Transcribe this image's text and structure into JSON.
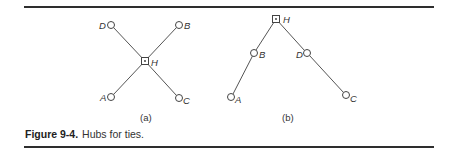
{
  "caption": {
    "number": "Figure 9-4.",
    "text": "Hubs for ties."
  },
  "panels": [
    {
      "id": "a",
      "label": "(a)",
      "hub": {
        "name": "H",
        "label": "H"
      },
      "nodes": [
        {
          "name": "D",
          "label": "D"
        },
        {
          "name": "B",
          "label": "B"
        },
        {
          "name": "A",
          "label": "A"
        },
        {
          "name": "C",
          "label": "C"
        }
      ],
      "edges": [
        [
          "H",
          "D"
        ],
        [
          "H",
          "B"
        ],
        [
          "H",
          "A"
        ],
        [
          "H",
          "C"
        ]
      ]
    },
    {
      "id": "b",
      "label": "(b)",
      "hub": {
        "name": "H",
        "label": "H"
      },
      "nodes": [
        {
          "name": "B",
          "label": "B"
        },
        {
          "name": "D",
          "label": "D"
        },
        {
          "name": "A",
          "label": "A"
        },
        {
          "name": "C",
          "label": "C"
        }
      ],
      "edges": [
        [
          "H",
          "B"
        ],
        [
          "B",
          "A"
        ],
        [
          "H",
          "D"
        ],
        [
          "D",
          "C"
        ]
      ]
    }
  ]
}
